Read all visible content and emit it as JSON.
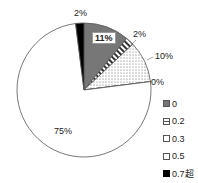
{
  "chart_data": {
    "type": "pie",
    "title": "",
    "categories": [
      "0",
      "0.2",
      "0.3",
      "0.4",
      "0.5",
      "0.7超"
    ],
    "values": [
      11,
      2,
      10,
      0,
      75,
      2
    ],
    "labels": [
      "11%",
      "2%",
      "10%",
      "0%",
      "75%",
      "2%"
    ],
    "legend": [
      "0",
      "0.2",
      "0.3",
      "0.5",
      "0.7超"
    ],
    "legend_position": "right",
    "fills": {
      "0": "#777777 dark gray fill",
      "0.2": "horizontal stripes",
      "0.3": "dotted pattern",
      "0.5": "#ffffff white",
      "0.7超": "#000000 black"
    }
  },
  "labels": {
    "l0": "11%",
    "l02": "2%",
    "l03": "10%",
    "l04": "0%",
    "l05": "75%",
    "l07": "2%"
  },
  "legend": [
    {
      "label": "0"
    },
    {
      "label": "0.2"
    },
    {
      "label": "0.3"
    },
    {
      "label": "0.5"
    },
    {
      "label": "0.7超"
    }
  ]
}
